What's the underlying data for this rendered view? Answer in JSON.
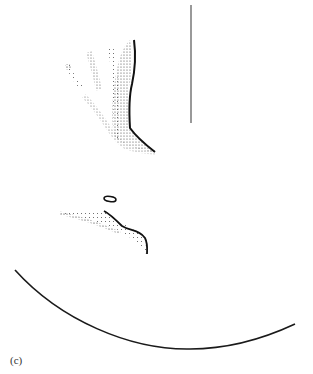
{
  "figure": {
    "panel_label": "(c)",
    "colors": {
      "background": "#ffffff",
      "ink": "#1a1a1a",
      "scale_bar": "#555555"
    },
    "elements": [
      {
        "name": "stippled-branching-structure",
        "description": "stippled drawing of a branching (finger-like) structure with four upward projections and a dark outlined right edge"
      },
      {
        "name": "scale-bar",
        "description": "vertical scale bar line"
      },
      {
        "name": "small-oval",
        "description": "small outlined oval"
      },
      {
        "name": "stippled-ridge",
        "description": "stippled curved ridge with dark outline on right"
      },
      {
        "name": "curved-arc",
        "description": "large arc curve across lower part of figure"
      }
    ]
  }
}
